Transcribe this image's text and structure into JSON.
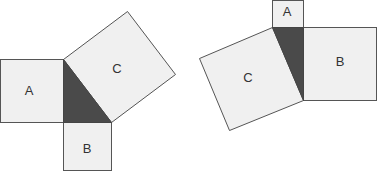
{
  "figures": [
    {
      "name": "left",
      "labels": {
        "a": "A",
        "b": "B",
        "c": "C"
      }
    },
    {
      "name": "right",
      "labels": {
        "a": "A",
        "b": "B",
        "c": "C"
      }
    }
  ],
  "colors": {
    "square_fill": "#f0f0f0",
    "triangle_fill": "#4a4a4a",
    "stroke": "#555555"
  }
}
